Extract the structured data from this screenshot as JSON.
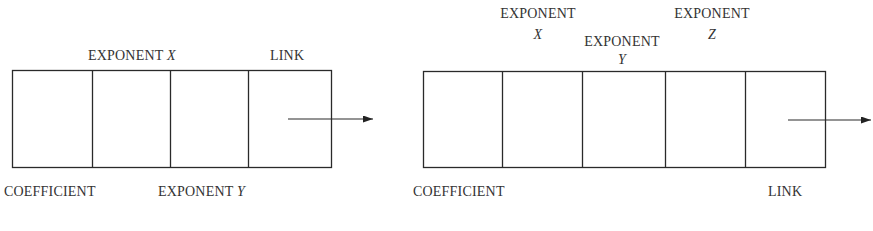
{
  "diagrams": [
    {
      "name": "two-variable-polynomial-node",
      "fields": [
        "COEFFICIENT",
        "EXPONENT X",
        "EXPONENT Y",
        "LINK"
      ],
      "labels": {
        "top": [
          {
            "text": "EXPONENT",
            "var": "X"
          },
          {
            "text": "LINK"
          }
        ],
        "bottom": [
          {
            "text": "COEFFICIENT"
          },
          {
            "text": "EXPONENT",
            "var": "Y"
          }
        ]
      },
      "arrow": "link-pointer"
    },
    {
      "name": "three-variable-polynomial-node",
      "fields": [
        "COEFFICIENT",
        "EXPONENT X",
        "EXPONENT Y",
        "EXPONENT Z",
        "LINK"
      ],
      "labels": {
        "top": [
          {
            "text": "EXPONENT",
            "var": "X"
          },
          {
            "text": "EXPONENT",
            "var": "Y"
          },
          {
            "text": "EXPONENT",
            "var": "Z"
          }
        ],
        "bottom": [
          {
            "text": "COEFFICIENT"
          },
          {
            "text": "LINK"
          }
        ]
      },
      "arrow": "link-pointer"
    }
  ],
  "colors": {
    "stroke": "#2a2a2a",
    "text": "#333333",
    "background": "#ffffff"
  }
}
